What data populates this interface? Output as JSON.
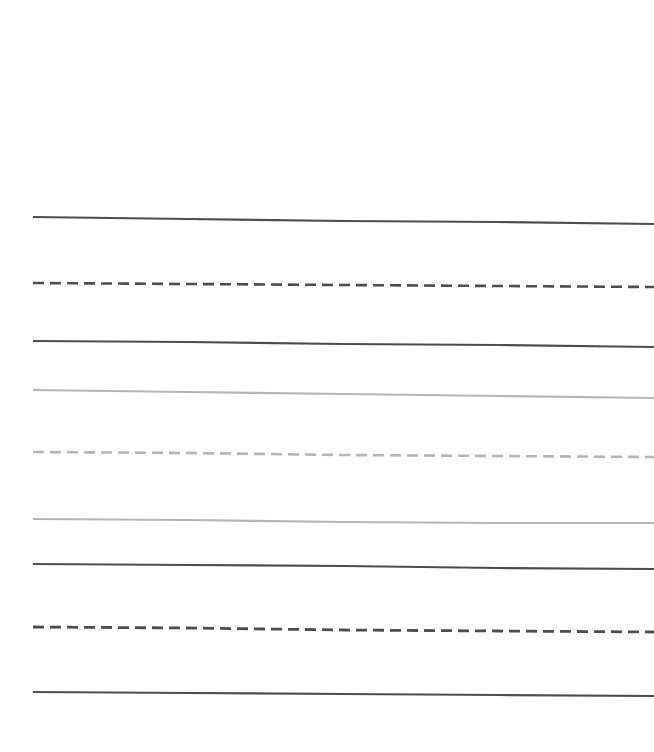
{
  "figure": {
    "width": 654,
    "height": 752,
    "background_color": "#ffffff",
    "plot_background_color": "#ffffff",
    "axes_visible": false,
    "ticks_visible": false,
    "grid_visible": false,
    "title": "",
    "legend_visible": false
  },
  "chart_data": {
    "type": "line",
    "title": "",
    "subtitle": "",
    "xlabel": "",
    "ylabel": "",
    "xlim": [
      0,
      100
    ],
    "ylim": [
      0,
      100
    ],
    "grid": false,
    "legend": false,
    "legend_position": "none",
    "x": [
      0,
      25,
      50,
      75,
      100
    ],
    "series": [
      {
        "name": "line-1",
        "color": "#4d4d4d",
        "style": "solid",
        "linewidth": 2.2,
        "values": [
          72.6,
          72.1,
          71.6,
          71.2,
          70.7
        ],
        "pixel_y": [
          217,
          219,
          221,
          222,
          224
        ]
      },
      {
        "name": "line-2",
        "color": "#4d4d4d",
        "style": "dashed",
        "linewidth": 2.6,
        "dash_pattern": [
          11,
          6
        ],
        "values": [
          63.8,
          63.5,
          63.2,
          62.9,
          62.6
        ],
        "pixel_y": [
          283,
          284,
          285,
          286,
          287
        ]
      },
      {
        "name": "line-3",
        "color": "#4d4d4d",
        "style": "solid",
        "linewidth": 2.2,
        "values": [
          56.1,
          55.9,
          55.6,
          55.3,
          55.0
        ],
        "pixel_y": [
          341,
          342,
          344,
          345,
          347
        ]
      },
      {
        "name": "line-4",
        "color": "#b5b5b5",
        "style": "solid",
        "linewidth": 2.2,
        "values": [
          49.5,
          49.1,
          48.8,
          48.4,
          48.1
        ],
        "pixel_y": [
          390,
          392,
          394,
          396,
          398
        ]
      },
      {
        "name": "line-5",
        "color": "#b5b5b5",
        "style": "dashed",
        "linewidth": 2.6,
        "dash_pattern": [
          11,
          6
        ],
        "values": [
          41.4,
          41.2,
          41.0,
          40.8,
          40.6
        ],
        "pixel_y": [
          452,
          453,
          455,
          456,
          457
        ]
      },
      {
        "name": "line-6",
        "color": "#b5b5b5",
        "style": "solid",
        "linewidth": 2.2,
        "values": [
          32.5,
          32.4,
          32.1,
          32.0,
          31.9
        ],
        "pixel_y": [
          519,
          520,
          522,
          523,
          523
        ]
      },
      {
        "name": "line-7",
        "color": "#4d4d4d",
        "style": "solid",
        "linewidth": 2.2,
        "values": [
          26.6,
          26.4,
          26.2,
          26.0,
          25.8
        ],
        "pixel_y": [
          564,
          565,
          566,
          568,
          569
        ]
      },
      {
        "name": "line-8",
        "color": "#4d4d4d",
        "style": "dashed",
        "linewidth": 2.8,
        "dash_pattern": [
          11,
          6
        ],
        "values": [
          18.2,
          18.1,
          17.9,
          17.8,
          17.6
        ],
        "pixel_y": [
          627,
          628,
          630,
          631,
          632
        ]
      },
      {
        "name": "line-9",
        "color": "#4d4d4d",
        "style": "solid",
        "linewidth": 2.2,
        "values": [
          9.6,
          9.5,
          9.4,
          9.3,
          9.2
        ],
        "pixel_y": [
          692,
          693,
          694,
          695,
          696
        ]
      }
    ],
    "x_start_px": 33,
    "x_end_px": 654
  }
}
